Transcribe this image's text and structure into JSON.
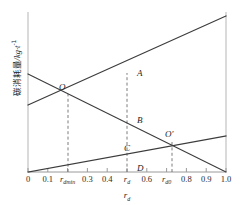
{
  "figure": {
    "y_axis_label_cn": "碳消耗量",
    "y_axis_label_unit": "/kg·t",
    "y_axis_label_exp": "-1",
    "x_axis_title": "r",
    "x_axis_title_sub": "d"
  },
  "x_ticks": [
    {
      "value": 0.0,
      "label": "0",
      "sub": "",
      "italic": false
    },
    {
      "value": 0.1,
      "label": "0.1",
      "sub": "",
      "italic": false
    },
    {
      "value": 0.2,
      "label": "r",
      "sub": "dmin",
      "italic": true
    },
    {
      "value": 0.3,
      "label": "0.3",
      "sub": "",
      "italic": false
    },
    {
      "value": 0.4,
      "label": "0.4",
      "sub": "",
      "italic": false
    },
    {
      "value": 0.5,
      "label": "r",
      "sub": "d",
      "italic": true
    },
    {
      "value": 0.6,
      "label": "0.6",
      "sub": "",
      "italic": false
    },
    {
      "value": 0.7,
      "label": "r",
      "sub": "d0",
      "italic": true
    },
    {
      "value": 0.8,
      "label": "0.8",
      "sub": "",
      "italic": false
    },
    {
      "value": 0.9,
      "label": "0.9",
      "sub": "",
      "italic": false
    },
    {
      "value": 1.0,
      "label": "1.0",
      "sub": "",
      "italic": false
    }
  ],
  "point_labels": [
    {
      "name": "A",
      "text": "A",
      "x": 137,
      "y": 76
    },
    {
      "name": "B",
      "text": "B",
      "x": 137,
      "y": 123
    },
    {
      "name": "C",
      "text": "C",
      "x": 124,
      "y": 151
    },
    {
      "name": "D",
      "text": "D",
      "x": 137,
      "y": 171
    },
    {
      "name": "O",
      "text": "O",
      "x": 59,
      "y": 90
    },
    {
      "name": "Oprime",
      "text": "O′",
      "x": 165,
      "y": 137
    }
  ],
  "chart_data": {
    "type": "line",
    "title": "",
    "xlabel": "r_d",
    "ylabel": "碳消耗量/kg·t⁻¹",
    "xlim": [
      0.0,
      1.0
    ],
    "ylim": [
      0.0,
      1.0
    ],
    "grid": false,
    "legend": "none",
    "xticks": [
      0.0,
      0.1,
      0.2,
      0.3,
      0.4,
      0.5,
      0.6,
      0.7,
      0.8,
      0.9,
      1.0
    ],
    "xticklabels": [
      "0",
      "0.1",
      "r_dmin",
      "0.3",
      "0.4",
      "r_d",
      "0.6",
      "r_d0",
      "0.8",
      "0.9",
      "1.0"
    ],
    "series": [
      {
        "name": "rising-steep-line",
        "comment": "upper rising straight line",
        "x": [
          0.0,
          1.0
        ],
        "y": [
          0.419,
          0.975
        ],
        "px": [
          [
            28,
            105
          ],
          [
            226,
            16
          ]
        ]
      },
      {
        "name": "descending-line",
        "comment": "falling straight line from left axis to bottom-right corner",
        "x": [
          0.0,
          1.0
        ],
        "y": [
          0.613,
          0.0
        ],
        "px": [
          [
            28,
            74
          ],
          [
            226,
            172
          ]
        ]
      },
      {
        "name": "rising-shallow-line",
        "comment": "shallow rising line from origin",
        "x": [
          0.0,
          1.0
        ],
        "y": [
          0.0,
          0.225
        ],
        "px": [
          [
            28,
            172
          ],
          [
            226,
            136
          ]
        ]
      }
    ],
    "intersections": [
      {
        "label": "O",
        "x": 0.202,
        "y": 0.494,
        "px": [
          68,
          93
        ]
      },
      {
        "label": "O′",
        "x": 0.727,
        "y": 0.2,
        "px": [
          172,
          140
        ]
      }
    ],
    "annotated_points": [
      {
        "label": "A",
        "x": 0.5,
        "y": 0.694,
        "px": [
          127,
          73
        ],
        "on_series": "rising-steep-line"
      },
      {
        "label": "B",
        "x": 0.5,
        "y": 0.406,
        "px": [
          127,
          120
        ],
        "on_series": "descending-line"
      },
      {
        "label": "C",
        "x": 0.5,
        "y": 0.113,
        "px": [
          127,
          154
        ],
        "on_series": "rising-shallow-line"
      },
      {
        "label": "D",
        "x": 0.5,
        "y": 0.0,
        "px": [
          127,
          172
        ],
        "on_series": "x-axis"
      }
    ],
    "vertical_dashed_lines": [
      {
        "at_label": "r_dmin",
        "x": 0.202,
        "from_y": 0.0,
        "to_y": 0.494
      },
      {
        "at_label": "r_d",
        "x": 0.5,
        "from_y": 0.0,
        "to_y": 0.694
      },
      {
        "at_label": "r_d0",
        "x": 0.727,
        "from_y": 0.0,
        "to_y": 0.2
      }
    ]
  },
  "colors": {
    "line": "#3c3c3c",
    "axis": "#9a9a9a",
    "dash": "#6e6e6e",
    "text": "#1d1d1d",
    "background": "#ffffff"
  }
}
